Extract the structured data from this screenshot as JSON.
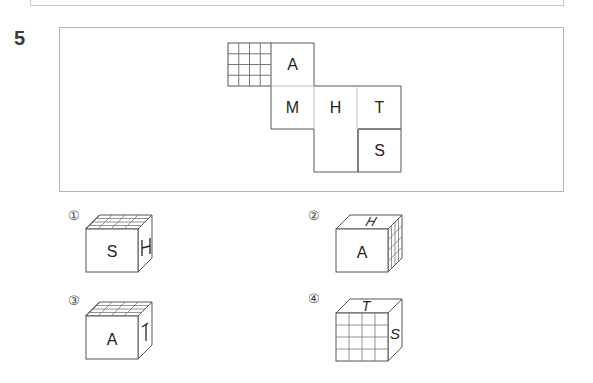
{
  "previous_box": {
    "visible": true
  },
  "question": {
    "number": "5",
    "net": {
      "faces": [
        {
          "id": "grid",
          "label": "",
          "pattern": "4x4-grid",
          "col": 0,
          "row": 0
        },
        {
          "id": "a",
          "label": "A",
          "col": 1,
          "row": 0
        },
        {
          "id": "m",
          "label": "M",
          "col": 1,
          "row": 1
        },
        {
          "id": "h",
          "label": "H",
          "col": 2,
          "row": 1
        },
        {
          "id": "t",
          "label": "T",
          "col": 3,
          "row": 1
        },
        {
          "id": "s",
          "label": "S",
          "col": 3,
          "row": 2
        }
      ]
    },
    "choices": [
      {
        "marker": "①",
        "front": "S",
        "top": "grid",
        "right": "H",
        "right_note": "H rotated 90°"
      },
      {
        "marker": "②",
        "front": "A",
        "top": "H",
        "right": "grid",
        "top_note": "H italic/skewed"
      },
      {
        "marker": "③",
        "front": "A",
        "top": "grid",
        "right": "T",
        "right_note": "T rotated"
      },
      {
        "marker": "④",
        "front": "grid",
        "top": "T",
        "right": "S",
        "top_note": "T skewed",
        "right_note": "S skewed"
      }
    ]
  },
  "colors": {
    "line": "#555555",
    "light_line": "#bbbbbb",
    "box_border": "#b5b5b5"
  }
}
